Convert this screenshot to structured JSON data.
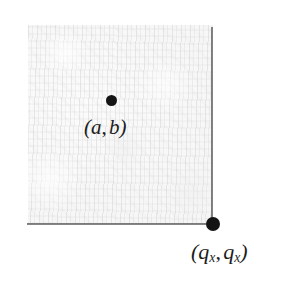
{
  "figure": {
    "background_color": "#ffffff",
    "region": {
      "name": "shaded-square-region",
      "fill_color": "#f4f4f4",
      "texture": "mottled-scanned-paper"
    },
    "axes": {
      "color": "#5d5d5d",
      "vertical_label": "",
      "horizontal_label": ""
    },
    "points": [
      {
        "id": "interior-point",
        "dot_color": "#141414",
        "label_open_paren": "(",
        "label_var1": "a",
        "label_comma": ",",
        "label_var2": "b",
        "label_close_paren": ")",
        "label_text": "(a, b)"
      },
      {
        "id": "corner-point",
        "dot_color": "#141414",
        "label_open_paren": "(",
        "label_var1": "q",
        "label_sub1": "x",
        "label_comma": ",",
        "label_var2": "q",
        "label_sub2": "x",
        "label_close_paren": ")",
        "label_text": "(qx, qx)"
      }
    ]
  }
}
